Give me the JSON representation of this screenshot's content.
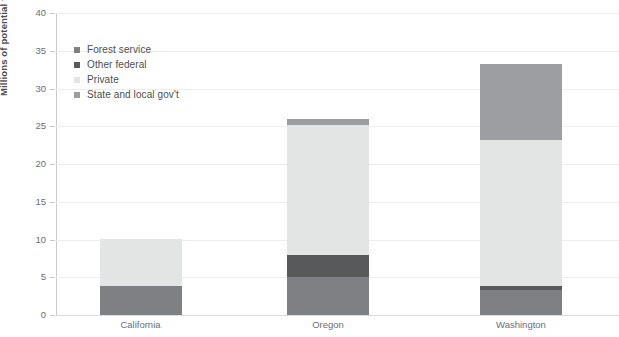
{
  "chart_data": {
    "type": "bar",
    "stacked": true,
    "title": "",
    "xlabel": "",
    "ylabel": "Millions of potential taps",
    "ylim": [
      0,
      40
    ],
    "yticks": [
      0,
      5,
      10,
      15,
      20,
      25,
      30,
      35,
      40
    ],
    "ytick_labels": [
      "0",
      "5",
      "10",
      "15",
      "20",
      "25",
      "30",
      "35",
      "40"
    ],
    "grid": "horizontal",
    "legend_position": "upper-left-inside",
    "categories": [
      "California",
      "Oregon",
      "Washington"
    ],
    "series": [
      {
        "name": "Forest service",
        "color": "#7f8083",
        "values": [
          3.9,
          5.0,
          3.3
        ]
      },
      {
        "name": "Other federal",
        "color": "#58595b",
        "values": [
          0.0,
          2.9,
          0.6
        ]
      },
      {
        "name": "Private",
        "color": "#e3e4e4",
        "values": [
          6.2,
          17.3,
          19.3
        ]
      },
      {
        "name": "State and local gov't",
        "color": "#9c9ea1",
        "values": [
          0.0,
          0.8,
          10.1
        ]
      }
    ],
    "totals": [
      10.1,
      26.0,
      33.3
    ],
    "colors": {
      "axis": "#c9cacb",
      "grid": "#ededee",
      "text": "#6d6e71",
      "title_text": "#4d4e50"
    }
  },
  "axis": {
    "y_title": "Millions of potential taps"
  },
  "legend": {
    "items": [
      {
        "label": "Forest service"
      },
      {
        "label": "Other federal"
      },
      {
        "label": "Private"
      },
      {
        "label": "State and local gov't"
      }
    ]
  }
}
